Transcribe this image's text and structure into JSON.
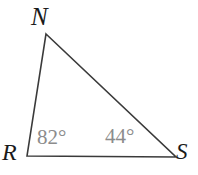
{
  "figure": {
    "kind": "geometry-diagram",
    "shape": "triangle",
    "name": "triangle-RNS",
    "background_color": "#ffffff",
    "width": 198,
    "height": 175,
    "stroke_color": "#3a3a3a",
    "stroke_width": 1.6,
    "vertex_label_color": "#1a1a1a",
    "angle_label_color": "#8c8c8c"
  },
  "vertices": [
    {
      "id": "N",
      "label": "N",
      "x": 46,
      "y": 34,
      "label_position": "above-left"
    },
    {
      "id": "R",
      "label": "R",
      "x": 27,
      "y": 156,
      "label_position": "left"
    },
    {
      "id": "S",
      "label": "S",
      "x": 176,
      "y": 157,
      "label_position": "right"
    }
  ],
  "edges": [
    {
      "id": "RN",
      "from": "R",
      "to": "N"
    },
    {
      "id": "NS",
      "from": "N",
      "to": "S"
    },
    {
      "id": "RS",
      "from": "R",
      "to": "S"
    }
  ],
  "angles": [
    {
      "id": "angle-R",
      "at_vertex": "R",
      "value": 82,
      "unit": "degrees",
      "label": "82°"
    },
    {
      "id": "angle-S",
      "at_vertex": "S",
      "value": 44,
      "unit": "degrees",
      "label": "44°"
    }
  ]
}
